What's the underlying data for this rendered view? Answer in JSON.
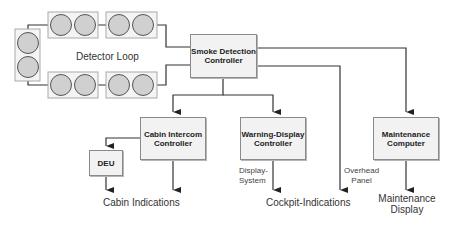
{
  "diagram": {
    "detector_loop": {
      "label": "Detector Loop",
      "detector_count": 10
    },
    "nodes": {
      "smoke_detection_controller": "Smoke Detection\nController",
      "cabin_intercom_controller": "Cabin Intercom\nController",
      "warning_display_controller": "Warning-Display\nController",
      "maintenance_computer": "Maintenance\nComputer",
      "deu": "DEU"
    },
    "outputs": {
      "cabin_indications": "Cabin Indications",
      "cockpit_indications": "Cockpit-Indications",
      "maintenance_display": "Maintenance\nDisplay"
    },
    "edge_labels": {
      "display_system": "Display-\nSystem",
      "overhead_panel": "Overhead\nPanel"
    },
    "colors": {
      "box_fill": "#f2f2f2",
      "detector_fill": "#d0d0d0",
      "line": "#333333"
    }
  }
}
